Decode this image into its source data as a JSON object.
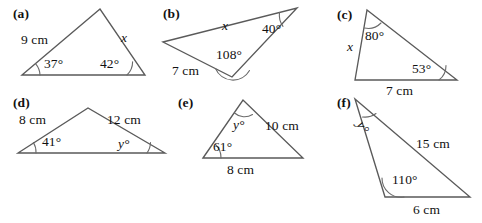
{
  "page": {
    "background_color": "#ffffff",
    "line_color": "#5a5a5a",
    "text_color": "#111111"
  },
  "figures": [
    {
      "key": "a",
      "part_label": "(a)",
      "labels": {
        "side_left": "9 cm",
        "side_right": "x",
        "angle_left": "37°",
        "angle_right": "42°"
      }
    },
    {
      "key": "b",
      "part_label": "(b)",
      "labels": {
        "side_top": "x",
        "side_lower_left": "7 cm",
        "angle_right": "40°",
        "angle_bottom": "108°"
      }
    },
    {
      "key": "c",
      "part_label": "(c)",
      "labels": {
        "side_left": "x",
        "side_bottom": "7 cm",
        "angle_top": "80°",
        "angle_right": "53°"
      }
    },
    {
      "key": "d",
      "part_label": "(d)",
      "labels": {
        "side_left": "8 cm",
        "side_right": "12 cm",
        "angle_left": "41°",
        "angle_right": "y°"
      }
    },
    {
      "key": "e",
      "part_label": "(e)",
      "labels": {
        "side_right": "10 cm",
        "side_bottom": "8 cm",
        "angle_top": "y°",
        "angle_left": "61°"
      }
    },
    {
      "key": "f",
      "part_label": "(f)",
      "labels": {
        "side_right": "15 cm",
        "side_bottom": "6 cm",
        "angle_top": "y°",
        "angle_bottom_left": "110°"
      }
    }
  ]
}
